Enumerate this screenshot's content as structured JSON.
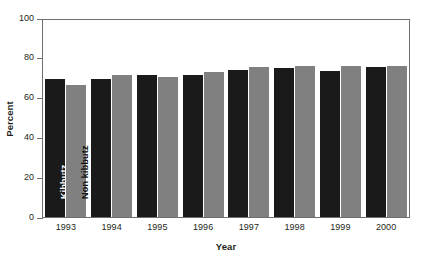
{
  "chart_data": {
    "type": "bar",
    "title": "",
    "xlabel": "Year",
    "ylabel": "Percent",
    "categories": [
      "1993",
      "1994",
      "1995",
      "1996",
      "1997",
      "1998",
      "1999",
      "2000"
    ],
    "ylim": [
      0,
      100
    ],
    "yticks": [
      0,
      20,
      40,
      60,
      80,
      100
    ],
    "grid": false,
    "legend_position": "in-bar",
    "series": [
      {
        "name": "Kibbutz",
        "color": "#1a1a1a",
        "values": [
          70,
          70,
          72,
          72,
          74.5,
          75.5,
          74,
          76
        ]
      },
      {
        "name": "Non kibbutz",
        "color": "#808080",
        "values": [
          67,
          72,
          71,
          73.5,
          76,
          76.5,
          76.5,
          76.5
        ]
      }
    ],
    "in_bar_labels": {
      "kibbutz": "Kibbutz",
      "non_kibbutz": "Non kibbutz"
    }
  }
}
